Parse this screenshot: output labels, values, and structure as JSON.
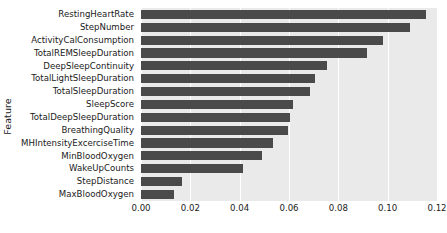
{
  "chart_data": {
    "type": "bar",
    "orientation": "horizontal",
    "title": "",
    "xlabel": "",
    "ylabel": "Feature",
    "xlim": [
      0.0,
      0.12
    ],
    "xticks": [
      "0.00",
      "0.02",
      "0.04",
      "0.06",
      "0.08",
      "0.10",
      "0.12"
    ],
    "xtick_values": [
      0.0,
      0.02,
      0.04,
      0.06,
      0.08,
      0.1,
      0.12
    ],
    "grid": true,
    "legend": null,
    "bar_color": "#4a4a4a",
    "plot_background": "#eaeaea",
    "categories": [
      "RestingHeartRate",
      "StepNumber",
      "ActivityCalConsumption",
      "TotalREMSleepDuration",
      "DeepSleepContinuity",
      "TotalLightSleepDuration",
      "TotalSleepDuration",
      "SleepScore",
      "TotalDeepSleepDuration",
      "BreathingQuality",
      "MHIntensityExcerciseTime",
      "MinBloodOxygen",
      "WakeUpCounts",
      "StepDistance",
      "MaxBloodOxygen"
    ],
    "values": [
      0.1157,
      0.109,
      0.098,
      0.0915,
      0.0755,
      0.0705,
      0.0685,
      0.0615,
      0.0605,
      0.0595,
      0.0535,
      0.049,
      0.0415,
      0.0165,
      0.0135
    ]
  }
}
